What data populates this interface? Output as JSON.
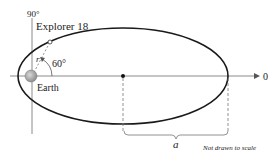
{
  "diagram": {
    "type": "orbit-ellipse",
    "labels": {
      "angle_axis": "90°",
      "satellite": "Explorer 18",
      "angle": "60°",
      "radius": "r",
      "planet": "Earth",
      "zero_axis": "0",
      "semi_major": "a",
      "note": "Not drawn to scale"
    },
    "colors": {
      "ellipse": "#1a1a1a",
      "axes": "#8a8a8a",
      "earth": "#a8a8a8",
      "dashed": "#777777"
    }
  }
}
